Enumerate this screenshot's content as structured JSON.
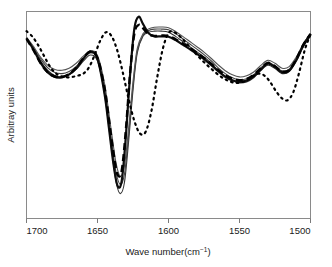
{
  "chart_data": {
    "type": "line",
    "title": "",
    "xlabel": "Wave number(cm−1)",
    "ylabel": "Arbitray units",
    "xlabel_main": "Wave number(cm",
    "xlabel_sup": "−1",
    "xlabel_close": ")",
    "xlim": [
      1700,
      1500
    ],
    "ylim": [
      0,
      1
    ],
    "x_reversed": true,
    "grid": false,
    "legend": "none",
    "y_ticks_shown": false,
    "xticks": [
      1700,
      1650,
      1600,
      1550,
      1500
    ],
    "xtick_labels": [
      "1700",
      "1650",
      "1600",
      "1550",
      "1500"
    ],
    "axis_color": "#7a7a7a",
    "series": [
      {
        "name": "sample-1-thin-solid",
        "style": "solid",
        "width": 1.1,
        "color": "#333333",
        "x": [
          1700,
          1695,
          1690,
          1685,
          1680,
          1675,
          1670,
          1665,
          1660,
          1655,
          1650,
          1645,
          1640,
          1637,
          1634,
          1631,
          1628,
          1625,
          1622,
          1618,
          1614,
          1610,
          1605,
          1600,
          1595,
          1590,
          1585,
          1580,
          1575,
          1570,
          1565,
          1560,
          1555,
          1550,
          1545,
          1540,
          1535,
          1530,
          1525,
          1520,
          1515,
          1510,
          1505,
          1500
        ],
        "y": [
          0.87,
          0.82,
          0.76,
          0.715,
          0.69,
          0.685,
          0.695,
          0.72,
          0.76,
          0.79,
          0.76,
          0.6,
          0.33,
          0.18,
          0.12,
          0.175,
          0.38,
          0.62,
          0.8,
          0.88,
          0.9,
          0.905,
          0.905,
          0.9,
          0.88,
          0.855,
          0.83,
          0.805,
          0.78,
          0.75,
          0.715,
          0.685,
          0.665,
          0.655,
          0.66,
          0.68,
          0.715,
          0.74,
          0.725,
          0.7,
          0.71,
          0.76,
          0.83,
          0.88
        ]
      },
      {
        "name": "sample-2-thin-solid",
        "style": "solid",
        "width": 1.1,
        "color": "#444444",
        "x": [
          1700,
          1695,
          1690,
          1685,
          1680,
          1675,
          1670,
          1665,
          1660,
          1655,
          1650,
          1645,
          1640,
          1637,
          1634,
          1631,
          1628,
          1625,
          1622,
          1618,
          1614,
          1610,
          1605,
          1600,
          1595,
          1590,
          1585,
          1580,
          1575,
          1570,
          1565,
          1560,
          1555,
          1550,
          1545,
          1540,
          1535,
          1530,
          1525,
          1520,
          1515,
          1510,
          1505,
          1500
        ],
        "y": [
          0.872,
          0.825,
          0.77,
          0.728,
          0.705,
          0.7,
          0.71,
          0.735,
          0.772,
          0.8,
          0.775,
          0.625,
          0.37,
          0.225,
          0.165,
          0.215,
          0.41,
          0.64,
          0.81,
          0.885,
          0.908,
          0.915,
          0.915,
          0.912,
          0.893,
          0.868,
          0.843,
          0.818,
          0.792,
          0.762,
          0.728,
          0.7,
          0.68,
          0.67,
          0.675,
          0.695,
          0.728,
          0.752,
          0.738,
          0.713,
          0.722,
          0.77,
          0.838,
          0.888
        ]
      },
      {
        "name": "sample-3-thin-solid",
        "style": "solid",
        "width": 1.1,
        "color": "#555555",
        "x": [
          1700,
          1695,
          1690,
          1685,
          1680,
          1675,
          1670,
          1665,
          1660,
          1655,
          1650,
          1645,
          1640,
          1637,
          1634,
          1631,
          1628,
          1625,
          1622,
          1618,
          1614,
          1610,
          1605,
          1600,
          1595,
          1590,
          1585,
          1580,
          1575,
          1570,
          1565,
          1560,
          1555,
          1550,
          1545,
          1540,
          1535,
          1530,
          1525,
          1520,
          1515,
          1510,
          1505,
          1500
        ],
        "y": [
          0.875,
          0.83,
          0.778,
          0.74,
          0.72,
          0.716,
          0.726,
          0.75,
          0.784,
          0.81,
          0.788,
          0.65,
          0.41,
          0.27,
          0.205,
          0.255,
          0.442,
          0.662,
          0.822,
          0.892,
          0.916,
          0.924,
          0.925,
          0.922,
          0.903,
          0.88,
          0.855,
          0.83,
          0.804,
          0.774,
          0.742,
          0.714,
          0.694,
          0.684,
          0.69,
          0.708,
          0.74,
          0.764,
          0.75,
          0.726,
          0.734,
          0.78,
          0.845,
          0.894
        ]
      },
      {
        "name": "sample-4-thick-solid",
        "style": "solid",
        "width": 2.2,
        "color": "#0d0d0d",
        "x": [
          1700,
          1695,
          1690,
          1685,
          1680,
          1675,
          1670,
          1665,
          1660,
          1655,
          1650,
          1645,
          1642,
          1639,
          1636,
          1633,
          1630,
          1627,
          1624,
          1621,
          1618,
          1614,
          1610,
          1605,
          1600,
          1595,
          1590,
          1585,
          1580,
          1575,
          1570,
          1565,
          1560,
          1555,
          1550,
          1545,
          1540,
          1535,
          1530,
          1525,
          1520,
          1515,
          1510,
          1505,
          1500
        ],
        "y": [
          0.872,
          0.815,
          0.752,
          0.706,
          0.684,
          0.682,
          0.696,
          0.726,
          0.772,
          0.806,
          0.772,
          0.6,
          0.44,
          0.275,
          0.16,
          0.18,
          0.4,
          0.7,
          0.92,
          0.975,
          0.94,
          0.895,
          0.88,
          0.88,
          0.878,
          0.862,
          0.84,
          0.818,
          0.795,
          0.77,
          0.742,
          0.712,
          0.685,
          0.668,
          0.66,
          0.666,
          0.686,
          0.72,
          0.748,
          0.732,
          0.706,
          0.714,
          0.766,
          0.838,
          0.89
        ]
      },
      {
        "name": "sample-5-bold-dashed",
        "style": "dashed",
        "width": 2.4,
        "color": "#000000",
        "dash": "7,4",
        "x": [
          1700,
          1695,
          1690,
          1685,
          1680,
          1675,
          1670,
          1665,
          1660,
          1655,
          1650,
          1645,
          1642,
          1639,
          1636,
          1633,
          1630,
          1627,
          1624,
          1621,
          1618,
          1614,
          1610,
          1605,
          1600,
          1595,
          1590,
          1585,
          1580,
          1575,
          1570,
          1565,
          1560,
          1555,
          1550,
          1545,
          1540,
          1535,
          1530,
          1525,
          1520,
          1515,
          1510,
          1505,
          1500
        ],
        "y": [
          0.868,
          0.812,
          0.75,
          0.706,
          0.686,
          0.684,
          0.698,
          0.728,
          0.774,
          0.806,
          0.776,
          0.63,
          0.48,
          0.33,
          0.215,
          0.23,
          0.43,
          0.705,
          0.895,
          0.935,
          0.92,
          0.89,
          0.882,
          0.884,
          0.882,
          0.866,
          0.845,
          0.824,
          0.8,
          0.776,
          0.748,
          0.718,
          0.692,
          0.676,
          0.668,
          0.674,
          0.694,
          0.726,
          0.752,
          0.736,
          0.71,
          0.718,
          0.77,
          0.84,
          0.892
        ]
      },
      {
        "name": "sample-6-dotted",
        "style": "dotted",
        "width": 2.2,
        "color": "#000000",
        "dash": "1.6,4.2",
        "x": [
          1700,
          1696,
          1692,
          1688,
          1684,
          1680,
          1676,
          1672,
          1668,
          1664,
          1660,
          1656,
          1652,
          1648,
          1644,
          1640,
          1636,
          1632,
          1628,
          1624,
          1620,
          1616,
          1612,
          1608,
          1604,
          1600,
          1596,
          1592,
          1588,
          1584,
          1580,
          1576,
          1572,
          1568,
          1564,
          1560,
          1556,
          1552,
          1548,
          1544,
          1540,
          1536,
          1532,
          1528,
          1524,
          1520,
          1516,
          1512,
          1508,
          1504,
          1500
        ],
        "y": [
          0.905,
          0.88,
          0.84,
          0.79,
          0.74,
          0.705,
          0.688,
          0.682,
          0.684,
          0.69,
          0.7,
          0.73,
          0.79,
          0.86,
          0.9,
          0.88,
          0.81,
          0.7,
          0.575,
          0.47,
          0.41,
          0.42,
          0.52,
          0.68,
          0.82,
          0.896,
          0.9,
          0.88,
          0.852,
          0.82,
          0.79,
          0.762,
          0.736,
          0.712,
          0.69,
          0.672,
          0.66,
          0.655,
          0.66,
          0.672,
          0.69,
          0.7,
          0.688,
          0.655,
          0.612,
          0.58,
          0.572,
          0.612,
          0.705,
          0.815,
          0.89
        ]
      }
    ]
  },
  "figure": {
    "background_color": "#ffffff",
    "frame_color": "#8a8a8a"
  }
}
